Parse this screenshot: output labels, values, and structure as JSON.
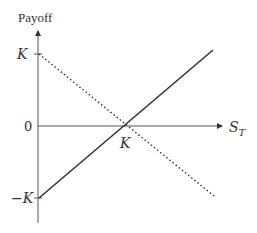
{
  "diagram": {
    "y_axis_label": "Payoff",
    "x_axis_label": "S",
    "x_axis_label_sub": "T",
    "y_ticks": [
      {
        "label": "K",
        "value": "K"
      },
      {
        "label": "0",
        "value": "0"
      },
      {
        "label": "−K",
        "value": "-K"
      }
    ],
    "x_ticks": [
      {
        "label": "K",
        "value": "K"
      }
    ],
    "lines": [
      {
        "name": "long-forward",
        "style": "solid",
        "from": [
          "0",
          "-K"
        ],
        "to": [
          "~1.7K",
          "~0.6K"
        ],
        "color": "#333333"
      },
      {
        "name": "short-forward",
        "style": "dotted",
        "from": [
          "0",
          "K"
        ],
        "to": [
          "~1.7K",
          "~-0.6K"
        ],
        "color": "#333333"
      }
    ]
  }
}
